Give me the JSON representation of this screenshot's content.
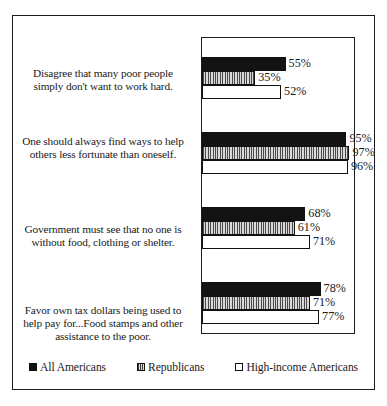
{
  "chart_data": {
    "type": "bar",
    "orientation": "horizontal",
    "title": "",
    "xlabel": "",
    "ylabel": "",
    "xlim": [
      0,
      100
    ],
    "grid": false,
    "legend_position": "bottom",
    "value_suffix": "%",
    "categories": [
      "Disagree that many poor people simply don't want to work hard.",
      "One should always find ways to help others less fortunate than oneself.",
      "Government must see that no one is without food, clothing or shelter.",
      "Favor own tax dollars being used to help pay for...Food stamps and other assistance to the poor."
    ],
    "series": [
      {
        "name": "All Americans",
        "swatch": "solid-black-square",
        "values": [
          55,
          95,
          68,
          78
        ],
        "labels": [
          "55%",
          "95%",
          "68%",
          "78%"
        ]
      },
      {
        "name": "Republicans",
        "swatch": "striped-square",
        "values": [
          35,
          97,
          61,
          71
        ],
        "labels": [
          "35%",
          "97%",
          "61%",
          "71%"
        ]
      },
      {
        "name": "High-income Americans",
        "swatch": "white-square",
        "values": [
          52,
          96,
          71,
          77
        ],
        "labels": [
          "52%",
          "96%",
          "71%",
          "77%"
        ]
      }
    ],
    "colors": {
      "all_americans": "#131313",
      "republicans": "#b9b9b9",
      "high_income": "#ffffff",
      "outline": "#111111",
      "frame": "#1c1c1c",
      "text": "#1a1a1a"
    }
  },
  "legend": {
    "items": [
      {
        "label": "All Americans"
      },
      {
        "label": "Republicans"
      },
      {
        "label": "High-income Americans"
      }
    ]
  }
}
